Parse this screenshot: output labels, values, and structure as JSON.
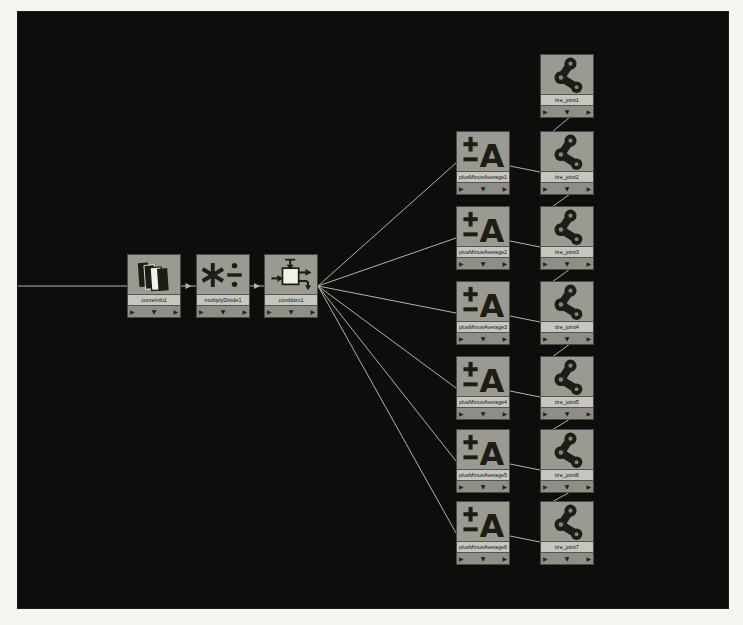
{
  "app": "hypergraph-node-network",
  "page": {
    "background": "#f5f5f0"
  },
  "canvas": {
    "x": 18,
    "y": 12,
    "width": 710,
    "height": 596,
    "background": "#0d0d0b",
    "wire_color": "#b3b3aa"
  },
  "colors": {
    "node_body": "#97978f",
    "node_label_strip": "#c6c6c0",
    "icon_dark": "#1d1d18",
    "icon_white": "#f1f1ea"
  },
  "footer": {
    "input_glyph": "▶",
    "menu_glyph": "▼",
    "output_glyph": "▶"
  },
  "nodes": [
    {
      "id": "curveInfo1",
      "label": "curveInfo1",
      "type": "curveInfo",
      "icon": "stacked-planes-icon",
      "x": 109,
      "y": 242
    },
    {
      "id": "multiplyDivide1",
      "label": "multiplyDivide1",
      "type": "multiplyDivide",
      "icon": "multiply-divide-icon",
      "x": 178,
      "y": 242
    },
    {
      "id": "condition1",
      "label": "condition1",
      "type": "condition",
      "icon": "condition-icon",
      "x": 246,
      "y": 242
    },
    {
      "id": "plusMinusAverage1",
      "label": "plusMinusAverage1",
      "type": "plusMinusAverage",
      "icon": "plus-minus-average-icon",
      "x": 438,
      "y": 119
    },
    {
      "id": "plusMinusAverage2",
      "label": "plusMinusAverage2",
      "type": "plusMinusAverage",
      "icon": "plus-minus-average-icon",
      "x": 438,
      "y": 194
    },
    {
      "id": "plusMinusAverage3",
      "label": "plusMinusAverage3",
      "type": "plusMinusAverage",
      "icon": "plus-minus-average-icon",
      "x": 438,
      "y": 269
    },
    {
      "id": "plusMinusAverage4",
      "label": "plusMinusAverage4",
      "type": "plusMinusAverage",
      "icon": "plus-minus-average-icon",
      "x": 438,
      "y": 344
    },
    {
      "id": "plusMinusAverage5",
      "label": "plusMinusAverage5",
      "type": "plusMinusAverage",
      "icon": "plus-minus-average-icon",
      "x": 438,
      "y": 417
    },
    {
      "id": "plusMinusAverage6",
      "label": "plusMinusAverage6",
      "type": "plusMinusAverage",
      "icon": "plus-minus-average-icon",
      "x": 438,
      "y": 489
    },
    {
      "id": "tire_joint1",
      "label": "tire_joint1",
      "type": "joint",
      "icon": "joint-chain-icon",
      "x": 522,
      "y": 42
    },
    {
      "id": "tire_joint2",
      "label": "tire_joint2",
      "type": "joint",
      "icon": "joint-chain-icon",
      "x": 522,
      "y": 119
    },
    {
      "id": "tire_joint3",
      "label": "tire_joint3",
      "type": "joint",
      "icon": "joint-chain-icon",
      "x": 522,
      "y": 194
    },
    {
      "id": "tire_joint4",
      "label": "tire_joint4",
      "type": "joint",
      "icon": "joint-chain-icon",
      "x": 522,
      "y": 269
    },
    {
      "id": "tire_joint5",
      "label": "tire_joint5",
      "type": "joint",
      "icon": "joint-chain-icon",
      "x": 522,
      "y": 344
    },
    {
      "id": "tire_joint6",
      "label": "tire_joint6",
      "type": "joint",
      "icon": "joint-chain-icon",
      "x": 522,
      "y": 417
    },
    {
      "id": "tire_joint7",
      "label": "tire_joint7",
      "type": "joint",
      "icon": "joint-chain-icon",
      "x": 522,
      "y": 489
    }
  ],
  "connections": [
    {
      "from": "offscreen-left",
      "to": "curveInfo1",
      "style": "straight"
    },
    {
      "from": "curveInfo1",
      "to": "multiplyDivide1",
      "style": "straight",
      "arrow": true
    },
    {
      "from": "multiplyDivide1",
      "to": "condition1",
      "style": "straight",
      "arrow": true
    },
    {
      "from": "condition1",
      "to": "plusMinusAverage1",
      "style": "fan"
    },
    {
      "from": "condition1",
      "to": "plusMinusAverage2",
      "style": "fan"
    },
    {
      "from": "condition1",
      "to": "plusMinusAverage3",
      "style": "fan"
    },
    {
      "from": "condition1",
      "to": "plusMinusAverage4",
      "style": "fan"
    },
    {
      "from": "condition1",
      "to": "plusMinusAverage5",
      "style": "fan"
    },
    {
      "from": "condition1",
      "to": "plusMinusAverage6",
      "style": "fan"
    },
    {
      "from": "plusMinusAverage1",
      "to": "tire_joint2",
      "style": "sloped"
    },
    {
      "from": "plusMinusAverage2",
      "to": "tire_joint3",
      "style": "sloped"
    },
    {
      "from": "plusMinusAverage3",
      "to": "tire_joint4",
      "style": "sloped"
    },
    {
      "from": "plusMinusAverage4",
      "to": "tire_joint5",
      "style": "sloped"
    },
    {
      "from": "plusMinusAverage5",
      "to": "tire_joint6",
      "style": "sloped"
    },
    {
      "from": "plusMinusAverage6",
      "to": "tire_joint7",
      "style": "sloped"
    },
    {
      "from": "tire_joint1",
      "to": "tire_joint2",
      "style": "chain"
    },
    {
      "from": "tire_joint2",
      "to": "tire_joint3",
      "style": "chain"
    },
    {
      "from": "tire_joint3",
      "to": "tire_joint4",
      "style": "chain"
    },
    {
      "from": "tire_joint4",
      "to": "tire_joint5",
      "style": "chain"
    },
    {
      "from": "tire_joint5",
      "to": "tire_joint6",
      "style": "chain"
    },
    {
      "from": "tire_joint6",
      "to": "tire_joint7",
      "style": "chain"
    }
  ]
}
